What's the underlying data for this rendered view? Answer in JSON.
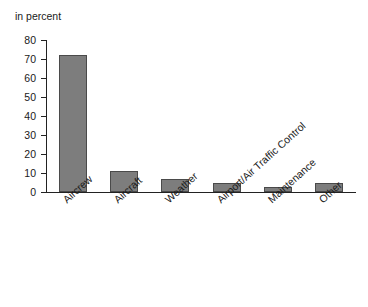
{
  "chart_data": {
    "type": "bar",
    "title": "",
    "subtitle": "",
    "axis_title": "in percent",
    "xlabel": "",
    "ylabel": "in percent",
    "ylim": [
      0,
      80
    ],
    "ytick_values": [
      0,
      10,
      20,
      30,
      40,
      50,
      60,
      70,
      80
    ],
    "ytick_labels": [
      "0",
      "10",
      "20",
      "30",
      "40",
      "50",
      "60",
      "70",
      "80"
    ],
    "grid": false,
    "legend": false,
    "legend_position": "none",
    "bar_color": "#7d7d7d",
    "bar_edge_color": "#4a4a4a",
    "axis_color": "#222222",
    "background_color": "#ffffff",
    "categories": [
      "Aircrew",
      "Aircraft",
      "Weather",
      "Airport/Air Traffic Control",
      "Maintenance",
      "Other"
    ],
    "values": [
      72,
      11,
      7,
      4.5,
      2.5,
      5
    ],
    "series": [
      {
        "name": "Share of causes",
        "values": [
          72,
          11,
          7,
          4.5,
          2.5,
          5
        ]
      }
    ]
  }
}
